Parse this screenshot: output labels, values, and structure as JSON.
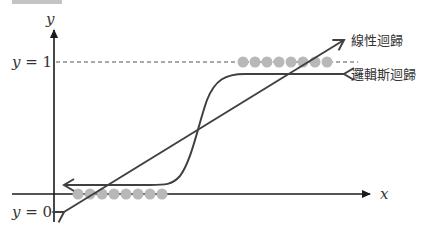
{
  "header": {
    "tag": "",
    "caption": ""
  },
  "axes": {
    "x_label": "x",
    "y_label": "y",
    "y1_label_var": "y",
    "y1_label_eq": " = 1",
    "y0_label_var": "y",
    "y0_label_eq": " = 0"
  },
  "legend": {
    "linear": "線性迴歸",
    "logistic": "邏輯斯迴歸"
  },
  "colors": {
    "line": "#404040",
    "axis": "#1a1a1a",
    "dots": "#b8b8b8",
    "dashed": "#555555"
  },
  "data_points": {
    "class_1_count": 8,
    "class_0_count": 8
  }
}
